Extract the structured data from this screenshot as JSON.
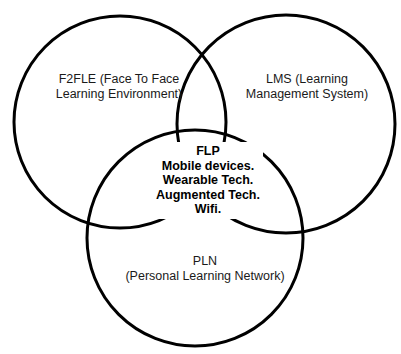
{
  "diagram": {
    "type": "venn",
    "stroke_color": "#000000",
    "background": "#ffffff",
    "sets": [
      {
        "id": "f2fle",
        "lines": [
          "F2FLE (Face To Face",
          "Learning Environment)"
        ]
      },
      {
        "id": "lms",
        "lines": [
          "LMS (Learning",
          "Management System)"
        ]
      },
      {
        "id": "pln",
        "lines": [
          "PLN",
          "(Personal Learning Network)"
        ]
      }
    ],
    "intersection": {
      "title": "FLP",
      "items": [
        "Mobile devices.",
        "Wearable Tech.",
        "Augmented Tech.",
        "Wifi."
      ]
    }
  }
}
